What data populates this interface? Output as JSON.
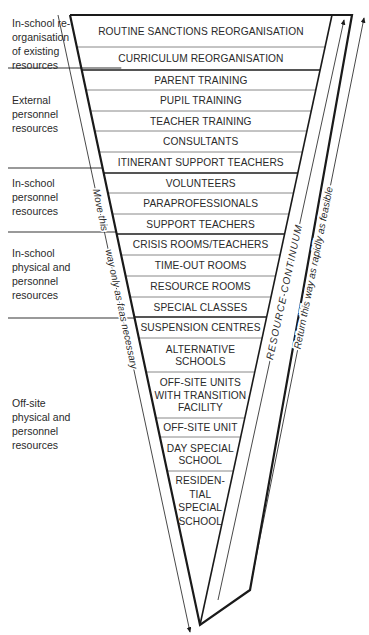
{
  "diagram": {
    "type": "funnel",
    "rows": [
      {
        "lines": [
          "ROUTINE SANCTIONS REORGANISATION"
        ],
        "y0": 15,
        "y1": 47
      },
      {
        "lines": [
          "CURRICULUM REORGANISATION"
        ],
        "y0": 47,
        "y1": 70
      },
      {
        "lines": [
          "PARENT TRAINING"
        ],
        "y0": 70,
        "y1": 90
      },
      {
        "lines": [
          "PUPIL TRAINING"
        ],
        "y0": 90,
        "y1": 111
      },
      {
        "lines": [
          "TEACHER TRAINING"
        ],
        "y0": 111,
        "y1": 131
      },
      {
        "lines": [
          "CONSULTANTS"
        ],
        "y0": 131,
        "y1": 152
      },
      {
        "lines": [
          "ITINERANT SUPPORT TEACHERS"
        ],
        "y0": 152,
        "y1": 173
      },
      {
        "lines": [
          "VOLUNTEERS"
        ],
        "y0": 173,
        "y1": 193
      },
      {
        "lines": [
          "PARAPROFESSIONALS"
        ],
        "y0": 193,
        "y1": 214
      },
      {
        "lines": [
          "SUPPORT TEACHERS"
        ],
        "y0": 214,
        "y1": 234
      },
      {
        "lines": [
          "CRISIS ROOMS/TEACHERS"
        ],
        "y0": 234,
        "y1": 255
      },
      {
        "lines": [
          "TIME-OUT ROOMS"
        ],
        "y0": 255,
        "y1": 276
      },
      {
        "lines": [
          "RESOURCE ROOMS"
        ],
        "y0": 276,
        "y1": 297
      },
      {
        "lines": [
          "SPECIAL CLASSES"
        ],
        "y0": 297,
        "y1": 317
      },
      {
        "lines": [
          "SUSPENSION CENTRES"
        ],
        "y0": 317,
        "y1": 338
      },
      {
        "lines": [
          "ALTERNATIVE",
          "SCHOOLS"
        ],
        "y0": 338,
        "y1": 372
      },
      {
        "lines": [
          "OFF-SITE UNITS",
          "WITH TRANSITION",
          "FACILITY"
        ],
        "y0": 372,
        "y1": 418
      },
      {
        "lines": [
          "OFF-SITE UNIT"
        ],
        "y0": 418,
        "y1": 437
      },
      {
        "lines": [
          "DAY SPECIAL",
          "SCHOOL"
        ],
        "y0": 437,
        "y1": 471
      },
      {
        "lines": [
          "RESIDEN-",
          "TIAL",
          "SPECIAL",
          "SCHOOL"
        ],
        "y0": 471,
        "y1": 530
      }
    ],
    "categories": [
      {
        "lines": [
          "In-school re-",
          "organisation",
          "of existing",
          "resources"
        ],
        "y": 27,
        "underline_last": true
      },
      {
        "lines": [
          "External",
          "personnel",
          "resources"
        ],
        "y": 104
      },
      {
        "lines": [
          "In-school",
          "personnel",
          "resources"
        ],
        "y": 187
      },
      {
        "lines": [
          "In-school",
          "physical and",
          "personnel",
          "resources"
        ],
        "y": 257
      },
      {
        "lines": [
          "Off-site",
          "physical and",
          "personnel",
          "resources"
        ],
        "y": 407
      }
    ],
    "left_arrow_label": [
      "Move this",
      "way only as far",
      "as necessary"
    ],
    "continuum_label": "RESOURCE CONTINUUM",
    "right_arrow_label": "Return this way as rapidly as feasible",
    "colors": {
      "ink": "#1a1a1a",
      "divider": "#777777",
      "background": "#ffffff"
    }
  }
}
